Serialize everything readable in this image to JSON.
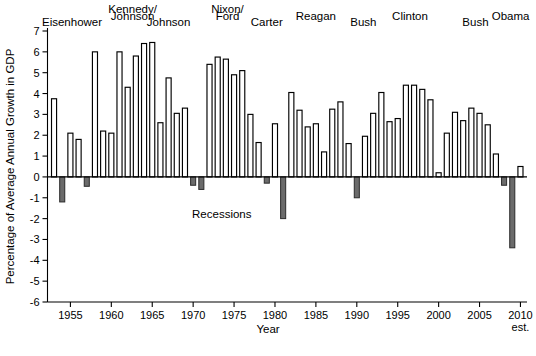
{
  "chart_data": {
    "type": "bar",
    "title": "",
    "xlabel": "Year",
    "ylabel": "Percentage of Average Annual Growth in GDP",
    "ylim": [
      -6,
      7
    ],
    "xlim": [
      1952.2,
      2010.8
    ],
    "grid": false,
    "legend_position": "none",
    "y_ticks": [
      7,
      6,
      5,
      4,
      3,
      2,
      1,
      0,
      -1,
      -2,
      -3,
      -4,
      -5,
      -6
    ],
    "y_tick_labels": [
      "7",
      "6",
      "5",
      "4",
      "3",
      "2",
      "1",
      "0",
      "-1",
      "-2",
      "-3",
      "-4",
      "-5",
      "-6"
    ],
    "x_ticks": [
      1955,
      1960,
      1965,
      1970,
      1975,
      1980,
      1985,
      1990,
      1995,
      2000,
      2005,
      2010
    ],
    "x_tick_labels": [
      "1955",
      "1960",
      "1965",
      "1970",
      "1975",
      "1980",
      "1985",
      "1990",
      "1995",
      "2000",
      "2005",
      "2010"
    ],
    "x_tick_sublabels": [
      "",
      "",
      "",
      "",
      "",
      "",
      "",
      "",
      "",
      "",
      "",
      "est."
    ],
    "categories": [
      "1953",
      "1954",
      "1955",
      "1956",
      "1957",
      "1958",
      "1959",
      "1960",
      "1961",
      "1962",
      "1963",
      "1964",
      "1965",
      "1966",
      "1967",
      "1968",
      "1969",
      "1970",
      "1971",
      "1972",
      "1973",
      "1974",
      "1975",
      "1976",
      "1977",
      "1978",
      "1979",
      "1980",
      "1981",
      "1982",
      "1983",
      "1984",
      "1985",
      "1986",
      "1987",
      "1988",
      "1989",
      "1990",
      "1991",
      "1992",
      "1993",
      "1994",
      "1995",
      "1996",
      "1997",
      "1998",
      "1999",
      "2000",
      "2001",
      "2002",
      "2003",
      "2004",
      "2005",
      "2006",
      "2007",
      "2008",
      "2009",
      "2010"
    ],
    "values": [
      3.75,
      -1.2,
      2.1,
      1.8,
      -0.45,
      6.0,
      2.2,
      2.1,
      6.0,
      4.3,
      5.8,
      6.4,
      6.45,
      2.6,
      4.75,
      3.05,
      3.3,
      -0.4,
      -0.6,
      5.4,
      5.75,
      5.65,
      4.9,
      5.1,
      3.0,
      1.65,
      -0.3,
      2.55,
      -2.0,
      4.05,
      3.2,
      2.4,
      2.55,
      1.2,
      3.25,
      3.6,
      1.6,
      -1.0,
      1.95,
      3.05,
      4.05,
      2.65,
      2.8,
      4.4,
      4.4,
      4.2,
      3.7,
      0.2,
      2.1,
      3.1,
      2.7,
      3.3,
      3.05,
      2.5,
      1.1,
      -0.4,
      -3.4,
      0.5
    ],
    "recession_years": [
      "1954",
      "1958",
      "1974",
      "1975",
      "1980",
      "1982",
      "1991",
      "2008",
      "2009"
    ],
    "bar_series_name": "Average Annual Growth in GDP",
    "annotations": [
      {
        "text": "Recessions",
        "x": 1973.5,
        "y": -1.8
      }
    ],
    "president_labels": [
      {
        "text": "Eisenhower",
        "x": 1955.2,
        "row": 1
      },
      {
        "text": "Kennedy/",
        "x": 1962.6,
        "row": 0
      },
      {
        "text": "Johnson",
        "x": 1962.6,
        "row": 0.5
      },
      {
        "text": "Johnson",
        "x": 1967.0,
        "row": 1
      },
      {
        "text": "Nixon/",
        "x": 1974.2,
        "row": 0
      },
      {
        "text": "Ford",
        "x": 1974.2,
        "row": 0.5
      },
      {
        "text": "Carter",
        "x": 1979.0,
        "row": 1
      },
      {
        "text": "Reagan",
        "x": 1985.0,
        "row": 0.5
      },
      {
        "text": "Bush",
        "x": 1990.8,
        "row": 1
      },
      {
        "text": "Clinton",
        "x": 1996.5,
        "row": 0.5
      },
      {
        "text": "Bush",
        "x": 2004.5,
        "row": 1
      },
      {
        "text": "Obama",
        "x": 2008.8,
        "row": 0.5
      }
    ]
  },
  "chart_meta": {
    "bar_fill_positive": "#ffffff",
    "bar_stroke_positive": "#000000",
    "bar_fill_negative": "#6b6b6b",
    "bar_stroke_negative": "#2b2b2b",
    "axis_color": "#000000",
    "background": "#ffffff"
  }
}
